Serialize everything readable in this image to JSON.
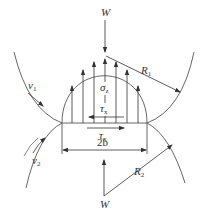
{
  "diagram": {
    "colors": {
      "line": "#444444",
      "background": "#ffffff"
    },
    "labels": {
      "load_top": {
        "text": "W"
      },
      "load_bottom": {
        "text": "W"
      },
      "radius_1": {
        "main": "R",
        "sub": "1"
      },
      "radius_2": {
        "main": "R",
        "sub": "2"
      },
      "velocity_1": {
        "main": "v",
        "sub": "1"
      },
      "velocity_2": {
        "main": "v",
        "sub": "2"
      },
      "normal_stress": {
        "main": "σ",
        "sub": "z"
      },
      "shear_stress_upper": {
        "main": "τ",
        "sub": "x"
      },
      "shear_stress_lower": {
        "main": "τ",
        "sub": "x"
      },
      "contact_width": {
        "text": "2b"
      }
    },
    "pressure_arrows_count": 7
  }
}
